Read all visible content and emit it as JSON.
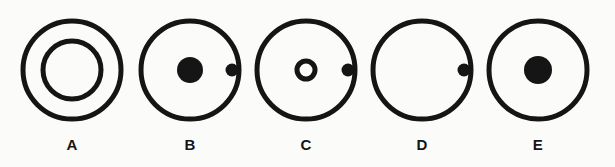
{
  "diagram": {
    "background_color": "#fbfbfa",
    "stroke_color": "#151515",
    "fill_color": "#151515",
    "label_color": "#151515",
    "options": [
      {
        "label": "A",
        "name": "option-a",
        "center_x": 72,
        "description": "Large circle containing a concentric smaller hollow circle",
        "outer_circle": {
          "cx": 58,
          "cy": 70,
          "r": 49,
          "stroke_width": 5,
          "fill": "none"
        },
        "shapes": [
          {
            "kind": "ring",
            "name": "inner-concentric-ring",
            "cx": 58,
            "cy": 70,
            "r": 29,
            "stroke_width": 5,
            "fill": "none"
          }
        ]
      },
      {
        "label": "B",
        "name": "option-b",
        "center_x": 190,
        "description": "Large circle containing a large filled dot at center and a small filled dot to the right",
        "outer_circle": {
          "cx": 58,
          "cy": 70,
          "r": 49,
          "stroke_width": 5,
          "fill": "none"
        },
        "shapes": [
          {
            "kind": "dot",
            "name": "center-large-dot",
            "cx": 58,
            "cy": 70,
            "r": 13,
            "fill": "#151515"
          },
          {
            "kind": "dot",
            "name": "right-small-dot",
            "cx": 100,
            "cy": 70,
            "r": 6.5,
            "fill": "#151515"
          }
        ]
      },
      {
        "label": "C",
        "name": "option-c",
        "center_x": 306,
        "description": "Large circle containing a small hollow ring at center and a small filled dot to the right",
        "outer_circle": {
          "cx": 58,
          "cy": 70,
          "r": 49,
          "stroke_width": 5,
          "fill": "none"
        },
        "shapes": [
          {
            "kind": "ring",
            "name": "center-small-ring",
            "cx": 58,
            "cy": 70,
            "r": 9,
            "stroke_width": 5,
            "fill": "none"
          },
          {
            "kind": "dot",
            "name": "right-small-dot",
            "cx": 100,
            "cy": 70,
            "r": 6.5,
            "fill": "#151515"
          }
        ]
      },
      {
        "label": "D",
        "name": "option-d",
        "center_x": 422,
        "description": "Large empty circle containing only a small filled dot near the right edge",
        "outer_circle": {
          "cx": 58,
          "cy": 70,
          "r": 49,
          "stroke_width": 5,
          "fill": "none"
        },
        "shapes": [
          {
            "kind": "dot",
            "name": "right-small-dot",
            "cx": 100,
            "cy": 70,
            "r": 6.5,
            "fill": "#151515"
          }
        ]
      },
      {
        "label": "E",
        "name": "option-e",
        "center_x": 538,
        "description": "Large circle containing only a large filled dot at center",
        "outer_circle": {
          "cx": 58,
          "cy": 70,
          "r": 49,
          "stroke_width": 5,
          "fill": "none"
        },
        "shapes": [
          {
            "kind": "dot",
            "name": "center-large-dot",
            "cx": 58,
            "cy": 70,
            "r": 14,
            "fill": "#151515"
          }
        ]
      }
    ]
  }
}
